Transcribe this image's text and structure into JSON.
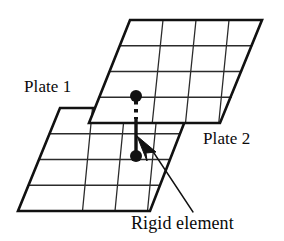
{
  "figure": {
    "background_color": "#ffffff",
    "line_color": "#111111",
    "mesh_color": "#2b2b2b",
    "labels": {
      "plate_1": "Plate 1",
      "plate_2": "Plate 2",
      "rigid_element": "Rigid element"
    },
    "plates": [
      {
        "id": "plate-1",
        "name": "Plate 1",
        "role": "lower-plate",
        "mesh_rows": 4,
        "mesh_cols": 4,
        "corners": [
          {
            "x": 60,
            "y": 108
          },
          {
            "x": 190,
            "y": 108
          },
          {
            "x": 150,
            "y": 211
          },
          {
            "x": 18,
            "y": 211
          }
        ]
      },
      {
        "id": "plate-2",
        "name": "Plate 2",
        "role": "upper-plate",
        "mesh_rows": 4,
        "mesh_cols": 4,
        "corners": [
          {
            "x": 130,
            "y": 20
          },
          {
            "x": 262,
            "y": 20
          },
          {
            "x": 220,
            "y": 123
          },
          {
            "x": 89,
            "y": 123
          }
        ]
      }
    ],
    "rigid_element": {
      "name": "Rigid element",
      "upper_node": {
        "x": 136,
        "y": 96,
        "radius": 6
      },
      "lower_node": {
        "x": 136,
        "y": 156,
        "radius": 6
      },
      "dashed_segment": {
        "from_y": 101,
        "to_y": 118
      },
      "solid_segment": {
        "from_y": 118,
        "to_y": 152
      },
      "arrow_tip": {
        "x": 139,
        "y": 138
      },
      "arrow_tail": {
        "x": 158,
        "y": 158
      }
    },
    "leader_line": {
      "from": {
        "x": 192,
        "y": 211
      },
      "to": {
        "x": 154,
        "y": 152
      }
    }
  }
}
